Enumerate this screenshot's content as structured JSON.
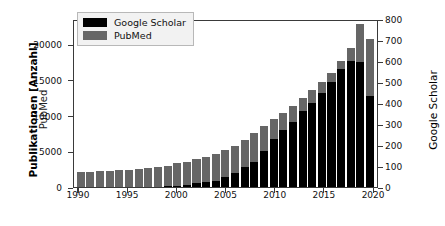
{
  "chart_data": {
    "type": "bar",
    "stacked": true,
    "title": "",
    "xlabel": "",
    "ylabel": "Publikationen [Anzahl]",
    "ylabel_secondary": "PubMed",
    "ylabel_right": "Google Scholar",
    "grid": false,
    "legend_position": "upper left",
    "x": [
      1990,
      1991,
      1992,
      1993,
      1994,
      1995,
      1996,
      1997,
      1998,
      1999,
      2000,
      2001,
      2002,
      2003,
      2004,
      2005,
      2006,
      2007,
      2008,
      2009,
      2010,
      2011,
      2012,
      2013,
      2014,
      2015,
      2016,
      2017,
      2018,
      2019,
      2020
    ],
    "xtick_labels": [
      "1990",
      "1995",
      "2000",
      "2005",
      "2010",
      "2015",
      "2020"
    ],
    "xtick_values": [
      1990,
      1995,
      2000,
      2005,
      2010,
      2015,
      2020
    ],
    "xlim": [
      1989.5,
      2020.5
    ],
    "ylim": [
      0,
      23500
    ],
    "ytick_values": [
      0,
      5000,
      10000,
      15000,
      20000
    ],
    "ytick_labels": [
      "0",
      "5000",
      "10000",
      "15000",
      "20000"
    ],
    "ylim_right": [
      0,
      800
    ],
    "ytick_values_right": [
      0,
      100,
      200,
      300,
      400,
      500,
      600,
      700,
      800
    ],
    "ytick_labels_right": [
      "0",
      "100",
      "200",
      "300",
      "400",
      "500",
      "600",
      "700",
      "800"
    ],
    "series": [
      {
        "name": "PubMed",
        "color": "#666666",
        "axis": "left",
        "values": [
          2100,
          2150,
          2250,
          2300,
          2400,
          2450,
          2500,
          2700,
          2850,
          3000,
          3300,
          3550,
          3900,
          4250,
          4600,
          5200,
          5800,
          6600,
          7550,
          8500,
          9500,
          10400,
          11400,
          12500,
          13600,
          14700,
          16000,
          17600,
          19400,
          22800,
          20700
        ]
      },
      {
        "name": "Google Scholar",
        "color": "#000000",
        "axis": "right",
        "values": [
          0,
          0,
          0,
          0,
          0,
          0,
          0,
          0,
          0,
          4,
          7,
          10,
          18,
          22,
          30,
          48,
          65,
          95,
          120,
          170,
          230,
          270,
          310,
          360,
          400,
          450,
          500,
          560,
          600,
          595,
          435
        ]
      }
    ]
  },
  "legend": {
    "items": [
      {
        "label": "Google Scholar",
        "color": "#000000"
      },
      {
        "label": "PubMed",
        "color": "#666666"
      }
    ]
  }
}
